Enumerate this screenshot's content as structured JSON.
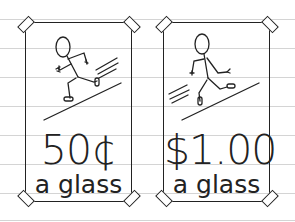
{
  "background": {
    "color": "#ffffff",
    "ruled_line_color": "#d4d4d4",
    "ruled_lines_y": [
      19,
      48,
      77,
      106,
      135,
      164,
      193,
      220
    ]
  },
  "cards": [
    {
      "price": "50¢",
      "unit": "a glass",
      "figure": "stick-figure-running-right"
    },
    {
      "price": "$1.00",
      "unit": "a glass",
      "figure": "stick-figure-running-right"
    }
  ],
  "colors": {
    "ink": "#222222"
  }
}
